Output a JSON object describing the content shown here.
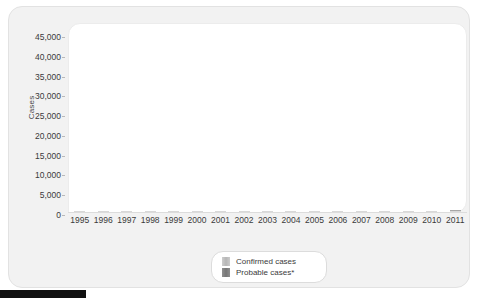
{
  "chart_data": {
    "type": "bar",
    "title": "",
    "xlabel": "",
    "ylabel": "Cases",
    "ylim": [
      0,
      45000
    ],
    "yticks": [
      45000,
      40000,
      35000,
      30000,
      25000,
      20000,
      15000,
      10000,
      5000,
      0
    ],
    "ytick_labels": [
      "45,000",
      "40,000",
      "35,000",
      "30,000",
      "25,000",
      "20,000",
      "15,000",
      "10,000",
      "5,000",
      "0"
    ],
    "grid": false,
    "stacked": true,
    "legend_position": "bottom-center",
    "categories": [
      "1995",
      "1996",
      "1997",
      "1998",
      "1999",
      "2000",
      "2001",
      "2002",
      "2003",
      "2004",
      "2005",
      "2006",
      "2007",
      "2008",
      "2009",
      "2010",
      "2011"
    ],
    "series": [
      {
        "name": "Confirmed cases",
        "color": "#bdbdbd",
        "values": [
          11700,
          16300,
          12800,
          16600,
          16300,
          17700,
          17100,
          23800,
          21300,
          19900,
          23400,
          20100,
          27400,
          33500,
          33900,
          25200,
          26000
        ]
      },
      {
        "name": "Probable cases*",
        "color": "#7e7e7e",
        "values": [
          0,
          0,
          0,
          0,
          0,
          0,
          0,
          0,
          0,
          0,
          0,
          0,
          0,
          0,
          0,
          0,
          12700
        ]
      }
    ],
    "totals": [
      11700,
      16300,
      12800,
      16600,
      16300,
      17700,
      17100,
      23800,
      21300,
      19900,
      23400,
      20100,
      27400,
      33500,
      33900,
      25200,
      38700
    ]
  },
  "legend": {
    "items": [
      {
        "label": "Confirmed cases",
        "swatch": "confirmed"
      },
      {
        "label": "Probable cases*",
        "swatch": "probable"
      }
    ]
  }
}
